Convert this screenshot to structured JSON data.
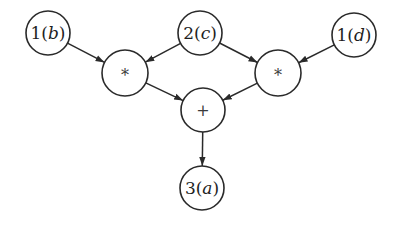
{
  "diagram": {
    "type": "expression-dag",
    "nodes": [
      {
        "id": "b",
        "value": "1",
        "var": "b",
        "x": 48,
        "y": 33,
        "r": 22
      },
      {
        "id": "c",
        "value": "2",
        "var": "c",
        "x": 200,
        "y": 33,
        "r": 22
      },
      {
        "id": "d",
        "value": "1",
        "var": "d",
        "x": 354,
        "y": 35,
        "r": 22
      },
      {
        "id": "mul1",
        "op": "*",
        "x": 125,
        "y": 73,
        "r": 23
      },
      {
        "id": "mul2",
        "op": "*",
        "x": 278,
        "y": 73,
        "r": 23
      },
      {
        "id": "add",
        "op": "+",
        "x": 203,
        "y": 110,
        "r": 22
      },
      {
        "id": "a",
        "value": "3",
        "var": "a",
        "x": 202,
        "y": 188,
        "r": 22
      }
    ],
    "edges": [
      {
        "from": "b",
        "to": "mul1"
      },
      {
        "from": "c",
        "to": "mul1"
      },
      {
        "from": "c",
        "to": "mul2"
      },
      {
        "from": "d",
        "to": "mul2"
      },
      {
        "from": "mul1",
        "to": "add"
      },
      {
        "from": "mul2",
        "to": "add"
      },
      {
        "from": "add",
        "to": "a"
      }
    ],
    "colors": {
      "stroke": "#2a2a2a",
      "background": "#ffffff",
      "text": "#1e1e1e"
    }
  }
}
